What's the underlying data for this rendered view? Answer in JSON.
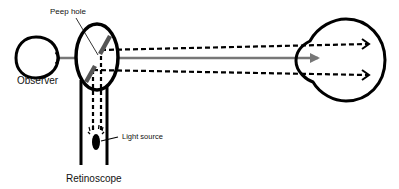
{
  "diagram": {
    "labels": {
      "peep_hole": "Peep hole",
      "observer": "Observer",
      "light_source": "Light source",
      "retinoscope": "Retinoscope"
    },
    "colors": {
      "outline": "#000000",
      "observation_axis": "#777777",
      "mirror": "#555555",
      "background": "#ffffff"
    },
    "elements": {
      "observer_eye": "small eye outline (left)",
      "retinoscope_head": "oval housing with tilted semi-silvered mirror",
      "retinoscope_handle": "vertical tube with light source",
      "patient_eye": "large eye outline (right)",
      "light_rays": "dashed arrows from source, reflected by mirror toward patient eye",
      "visual_axis": "solid gray arrow from observer through peep hole to patient eye"
    }
  }
}
